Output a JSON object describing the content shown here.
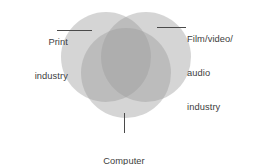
{
  "figure": {
    "type": "venn-diagram-3-circle",
    "background_color": "#ffffff",
    "text_color": "#3d3d3d",
    "leader_line_color": "#4a4a4a",
    "circle_fill_color": "#9b9b9b",
    "circle_opacity": 0.42
  },
  "labels": {
    "print": {
      "line1": "Print",
      "line2": "industry"
    },
    "film": {
      "line1": "Film/video/",
      "line2": "audio",
      "line3": "industry"
    },
    "computer": {
      "line1": "Computer",
      "line2": "industry"
    }
  },
  "chart_data": {
    "type": "pie",
    "title": "",
    "categories": [
      "Print industry",
      "Film/video/audio industry",
      "Computer industry"
    ],
    "values": [
      1,
      1,
      1
    ],
    "sets": [
      {
        "name": "Print industry",
        "cx": 106,
        "cy": 57,
        "r": 45,
        "label_position": "top-left"
      },
      {
        "name": "Film/video/audio industry",
        "cx": 146,
        "cy": 57,
        "r": 45,
        "label_position": "top-right"
      },
      {
        "name": "Computer industry",
        "cx": 126,
        "cy": 73,
        "r": 45,
        "label_position": "bottom-center"
      }
    ],
    "intersection_shading": "all three sets overlap in the dark center region",
    "legend": "none",
    "grid": false
  }
}
